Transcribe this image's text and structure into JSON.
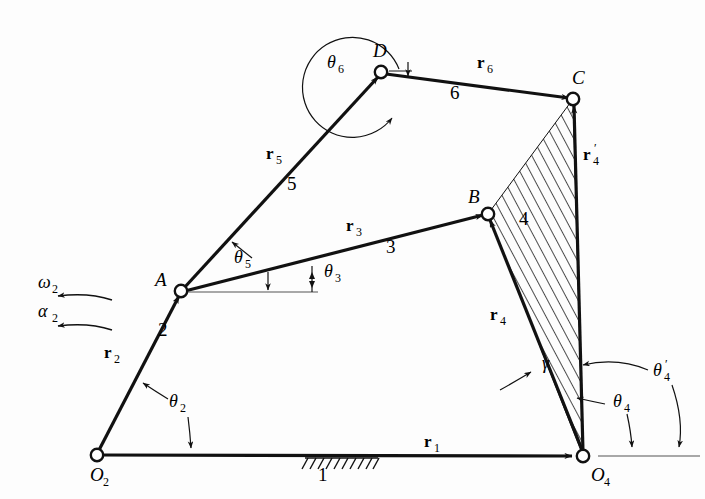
{
  "figure": {
    "type": "kinematic-linkage-diagram",
    "background_color": "#fdfdfd",
    "line_color": "#111111"
  },
  "joints": [
    {
      "id": "O2",
      "label": "O",
      "sub": "2",
      "x": 97,
      "y": 455,
      "kind": "ground-pivot"
    },
    {
      "id": "A",
      "label": "A",
      "sub": "",
      "x": 181,
      "y": 291,
      "kind": "pin-joint"
    },
    {
      "id": "B",
      "label": "B",
      "sub": "",
      "x": 488,
      "y": 214,
      "kind": "pin-joint"
    },
    {
      "id": "C",
      "label": "C",
      "sub": "",
      "x": 573,
      "y": 99,
      "kind": "pin-joint"
    },
    {
      "id": "D",
      "label": "D",
      "sub": "",
      "x": 381,
      "y": 72,
      "kind": "pin-joint"
    },
    {
      "id": "O4",
      "label": "O",
      "sub": "4",
      "x": 583,
      "y": 456,
      "kind": "ground-pivot"
    }
  ],
  "links": [
    {
      "id": "link1",
      "number": "1",
      "from": "O2",
      "to": "O4",
      "vector": "r",
      "vector_sub": "1",
      "prime": false
    },
    {
      "id": "link2",
      "number": "2",
      "from": "O2",
      "to": "A",
      "vector": "r",
      "vector_sub": "2",
      "prime": false
    },
    {
      "id": "link3",
      "number": "3",
      "from": "A",
      "to": "B",
      "vector": "r",
      "vector_sub": "3",
      "prime": false
    },
    {
      "id": "link4",
      "number": "4",
      "from": "O4",
      "to": "B",
      "vector": "r",
      "vector_sub": "4",
      "prime": false
    },
    {
      "id": "link4p",
      "number": "",
      "from": "O4",
      "to": "C",
      "vector": "r",
      "vector_sub": "4",
      "prime": true
    },
    {
      "id": "link5",
      "number": "5",
      "from": "A",
      "to": "D",
      "vector": "r",
      "vector_sub": "5",
      "prime": false
    },
    {
      "id": "link6",
      "number": "6",
      "from": "D",
      "to": "C",
      "vector": "r",
      "vector_sub": "6",
      "prime": false
    }
  ],
  "vector_labels": [
    {
      "name": "r1",
      "text": "r",
      "sub": "1",
      "prime": false,
      "x": 430,
      "y": 447
    },
    {
      "name": "r2",
      "text": "r",
      "sub": "2",
      "prime": false,
      "x": 110,
      "y": 358
    },
    {
      "name": "r3",
      "text": "r",
      "sub": "3",
      "prime": false,
      "x": 352,
      "y": 231
    },
    {
      "name": "r4",
      "text": "r",
      "sub": "4",
      "prime": false,
      "x": 496,
      "y": 320
    },
    {
      "name": "r4-prime",
      "text": "r",
      "sub": "4",
      "prime": true,
      "x": 589,
      "y": 160
    },
    {
      "name": "r5",
      "text": "r",
      "sub": "5",
      "prime": false,
      "x": 272,
      "y": 159
    },
    {
      "name": "r6",
      "text": "r",
      "sub": "6",
      "prime": false,
      "x": 483,
      "y": 68
    }
  ],
  "link_numbers": [
    {
      "name": "link-number-1",
      "text": "1",
      "x": 318,
      "y": 481
    },
    {
      "name": "link-number-2",
      "text": "2",
      "x": 158,
      "y": 336
    },
    {
      "name": "link-number-3",
      "text": "3",
      "x": 386,
      "y": 253
    },
    {
      "name": "link-number-4",
      "text": "4",
      "x": 519,
      "y": 225
    },
    {
      "name": "link-number-5",
      "text": "5",
      "x": 287,
      "y": 190
    },
    {
      "name": "link-number-6",
      "text": "6",
      "x": 450,
      "y": 99
    }
  ],
  "angle_labels": [
    {
      "name": "theta-2",
      "greek": "θ",
      "sub": "2",
      "prime": false,
      "x": 175,
      "y": 407
    },
    {
      "name": "theta-3",
      "greek": "θ",
      "sub": "3",
      "prime": false,
      "x": 330,
      "y": 277
    },
    {
      "name": "theta-4",
      "greek": "θ",
      "sub": "4",
      "prime": false,
      "x": 619,
      "y": 407
    },
    {
      "name": "theta-4-prime",
      "greek": "θ",
      "sub": "4",
      "prime": true,
      "x": 662,
      "y": 376
    },
    {
      "name": "theta-5",
      "greek": "θ",
      "sub": "5",
      "prime": false,
      "x": 240,
      "y": 263
    },
    {
      "name": "theta-6",
      "greek": "θ",
      "sub": "6",
      "prime": false,
      "x": 333,
      "y": 68
    },
    {
      "name": "gamma",
      "greek": "γ",
      "sub": "",
      "prime": false,
      "x": 548,
      "y": 369
    }
  ],
  "motion_labels": [
    {
      "name": "omega-2",
      "greek": "ω",
      "sub": "2",
      "x": 47,
      "y": 288,
      "description": "angular velocity of link 2, counterclockwise"
    },
    {
      "name": "alpha-2",
      "greek": "α",
      "sub": "2",
      "x": 47,
      "y": 317,
      "description": "angular acceleration of link 2, counterclockwise"
    }
  ],
  "ground_symbol": {
    "name": "ground-hatch",
    "x_start": 305,
    "x_end": 378,
    "y": 457,
    "label": "1"
  },
  "ternary_link": {
    "name": "link-4-ternary-body",
    "number": "4",
    "hatched": true,
    "vertices": [
      "B",
      "C",
      "O4"
    ]
  }
}
